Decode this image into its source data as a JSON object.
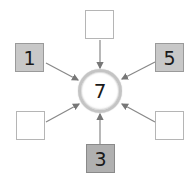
{
  "diagram": {
    "center": {
      "value": "7"
    },
    "boxes": [
      {
        "position": "top",
        "value": ""
      },
      {
        "position": "left",
        "value": "1"
      },
      {
        "position": "right",
        "value": "5"
      },
      {
        "position": "bottom-left",
        "value": ""
      },
      {
        "position": "bottom-right",
        "value": ""
      },
      {
        "position": "bottom",
        "value": "3"
      }
    ],
    "colors": {
      "arrow": "#888888",
      "filled_box": "#c8c8c8",
      "empty_box": "#ffffff"
    }
  }
}
